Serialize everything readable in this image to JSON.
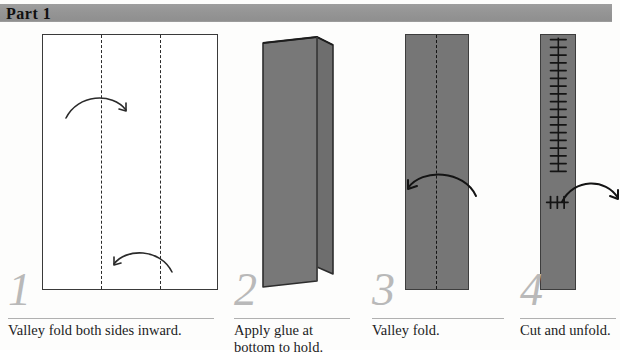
{
  "header": {
    "title": "Part 1",
    "banner_color": "#959595"
  },
  "palette": {
    "paper_gray": "#767676",
    "outline": "#3d3d3d",
    "step_number_gray": "#b9b9b9",
    "rule_gray": "#b0b0b0",
    "text": "#1c1c1c",
    "page_background": "#fdfdfc"
  },
  "steps": [
    {
      "number": "1",
      "caption": "Valley fold both sides inward.",
      "figure": "white-sheet-two-dashed-fold-lines",
      "arrows": [
        "curve-right-over-left-fold",
        "curve-left-over-right-fold"
      ]
    },
    {
      "number": "2",
      "caption_line1": "Apply glue at",
      "caption_line2": "bottom to hold.",
      "figure": "folded-booklet-perspective",
      "arrows": []
    },
    {
      "number": "3",
      "caption": "Valley fold.",
      "figure": "gray-strip-center-dashed-line",
      "arrows": [
        "curve-left"
      ]
    },
    {
      "number": "4",
      "caption": "Cut and unfold.",
      "figure": "narrow-strip-with-cut-marks",
      "arrows": [
        "curve-right"
      ]
    }
  ]
}
